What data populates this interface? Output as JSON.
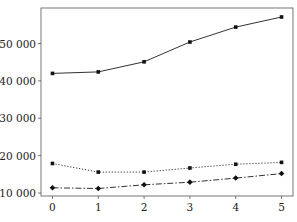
{
  "chart_data": {
    "type": "line",
    "title": "",
    "xlabel": "",
    "ylabel": "",
    "x": [
      0,
      1,
      2,
      3,
      4,
      5
    ],
    "x_tick_labels": [
      "0",
      "1",
      "2",
      "3",
      "4",
      "5"
    ],
    "y_tick_values": [
      10000,
      20000,
      30000,
      40000,
      50000
    ],
    "y_tick_labels": [
      "10 000",
      "20 000",
      "30 000",
      "40 000",
      "50 000"
    ],
    "ylim": [
      9200,
      59500
    ],
    "xlim": [
      -0.25,
      5.25
    ],
    "grid": false,
    "legend": null,
    "series": [
      {
        "name": "solid",
        "style": "solid",
        "color": "#333333",
        "values": [
          42000,
          42400,
          45100,
          50400,
          54400,
          57100
        ]
      },
      {
        "name": "dotted",
        "style": "dotted",
        "color": "#333333",
        "values": [
          17900,
          15600,
          15600,
          16700,
          17700,
          18200
        ]
      },
      {
        "name": "dash-dot",
        "style": "dashdot",
        "color": "#333333",
        "values": [
          11400,
          11200,
          12200,
          12900,
          14000,
          15200
        ]
      }
    ]
  }
}
